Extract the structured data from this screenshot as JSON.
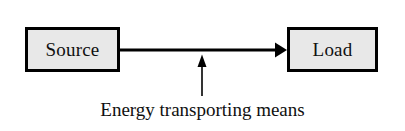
{
  "figure": {
    "background_color": "#ffffff",
    "stroke_color": "#000000",
    "block_fill_color": "#e8e8e8",
    "text_color": "#101010"
  },
  "blocks": [
    {
      "id": "source",
      "label": "Source"
    },
    {
      "id": "load",
      "label": "Load"
    }
  ],
  "arrows": [
    {
      "id": "energy-flow",
      "direction": "right",
      "from": "source",
      "to": "load",
      "label": ""
    },
    {
      "id": "pointer",
      "direction": "up",
      "from": "caption",
      "to": "energy-flow",
      "label": ""
    }
  ],
  "caption": {
    "text": "Energy transporting means"
  }
}
